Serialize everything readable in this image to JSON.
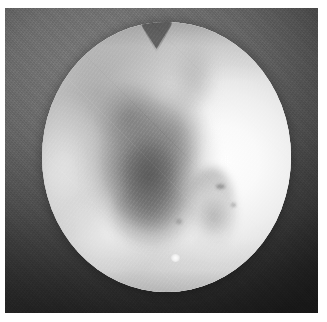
{
  "image": {
    "kind": "grayscale-photograph",
    "modality_hint": "circular field-of-view medical image",
    "alt_text": "Grayscale circular field-of-view photograph showing a bright disc with a dark mottled central region and a notch at the top edge",
    "width_px": 327,
    "height_px": 322
  },
  "plate": {
    "name": "photographic plate",
    "left_px": 5,
    "top_px": 8,
    "width_px": 313,
    "height_px": 305,
    "background_top_hex": "#7e7e7e",
    "background_bottom_hex": "#2f2f2f",
    "texture": "film-grain"
  },
  "field_of_view": {
    "name": "circular aperture",
    "shape": "ellipse",
    "left_px": 42,
    "top_px": 22,
    "width_px": 249,
    "height_px": 270,
    "fill_light_hex": "#ffffff",
    "fill_mid_hex": "#dcdcdc",
    "fill_edge_hex": "#c9c9c9"
  },
  "features": [
    {
      "name": "top-notch",
      "description": "V-shaped notch cut into the upper border of the circular field",
      "position": "top-center",
      "color_hex": "#5a5a5a"
    },
    {
      "name": "central-lesion",
      "description": "Dark mottled irregular region occupying the center-left of the field",
      "position": "center-left",
      "color_hex": "#606060"
    },
    {
      "name": "bright-zone",
      "description": "Very bright, near-white region on the right half of the field",
      "position": "right",
      "color_hex": "#ffffff"
    },
    {
      "name": "right-streak",
      "description": "Faint curving darker streak below and right of the lesion",
      "position": "lower-right-of-center",
      "color_hex": "#787878"
    },
    {
      "name": "highlight-spot",
      "description": "Small intense white highlight near the lower border",
      "position": "bottom-center",
      "color_hex": "#ffffff"
    }
  ],
  "margins": {
    "name": "paper margin",
    "color_hex": "#ffffff",
    "left_px": 5,
    "top_px": 8,
    "right_px": 9,
    "bottom_px": 9
  }
}
